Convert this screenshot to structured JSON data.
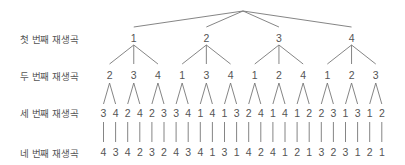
{
  "labels": {
    "row1": "첫 번째 재생곡",
    "row2": "두 번째 재생곡",
    "row3": "세 번째 재생곡",
    "row4": "네 번째 재생곡"
  },
  "tree": {
    "root": {
      "x": 243,
      "y": 11
    },
    "row1": [
      "1",
      "2",
      "3",
      "4"
    ],
    "row2": [
      "2",
      "3",
      "4",
      "1",
      "3",
      "4",
      "1",
      "2",
      "4",
      "1",
      "2",
      "3"
    ],
    "row3": [
      "3",
      "4",
      "2",
      "4",
      "2",
      "3",
      "3",
      "4",
      "1",
      "4",
      "1",
      "3",
      "2",
      "4",
      "1",
      "4",
      "1",
      "2",
      "2",
      "3",
      "1",
      "3",
      "1",
      "2"
    ],
    "row4": [
      "4",
      "3",
      "4",
      "2",
      "3",
      "2",
      "4",
      "3",
      "4",
      "1",
      "3",
      "1",
      "4",
      "2",
      "4",
      "1",
      "2",
      "1",
      "3",
      "2",
      "3",
      "1",
      "2",
      "1"
    ]
  },
  "colors": {
    "line": "#777777",
    "text": "#555555"
  }
}
